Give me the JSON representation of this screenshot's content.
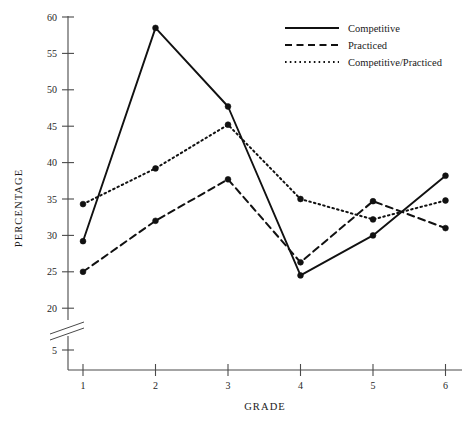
{
  "chart_data": {
    "type": "line",
    "title": "",
    "xlabel": "GRADE",
    "ylabel": "PERCENTAGE",
    "x": [
      1,
      2,
      3,
      4,
      5,
      6
    ],
    "categories": [
      "1",
      "2",
      "3",
      "4",
      "5",
      "6"
    ],
    "xlim": [
      1,
      6
    ],
    "ylim": [
      5,
      60
    ],
    "axis_break": {
      "present": true,
      "between": [
        5,
        20
      ],
      "style": "zigzag"
    },
    "grid": false,
    "legend_position": "top-right",
    "y_ticks": [
      60,
      55,
      50,
      45,
      40,
      35,
      30,
      25,
      20,
      5
    ],
    "y_tick_labels": [
      "60",
      "55",
      "50",
      "45",
      "40",
      "35",
      "30",
      "25",
      "20",
      "5"
    ],
    "x_ticks": [
      1,
      2,
      3,
      4,
      5,
      6
    ],
    "x_tick_labels": [
      "1",
      "2",
      "3",
      "4",
      "5",
      "6"
    ],
    "series": [
      {
        "name": "Competitive",
        "style": "solid",
        "color": "#111111",
        "marker": "circle",
        "values": [
          29.2,
          58.5,
          47.7,
          24.5,
          30.0,
          38.2
        ]
      },
      {
        "name": "Practiced",
        "style": "dashed",
        "color": "#111111",
        "marker": "circle",
        "values": [
          25.0,
          32.0,
          37.7,
          26.3,
          34.7,
          31.0
        ]
      },
      {
        "name": "Competitive/Practiced",
        "style": "dotted",
        "color": "#111111",
        "marker": "circle",
        "values": [
          34.3,
          39.2,
          45.2,
          35.0,
          32.2,
          34.8
        ]
      }
    ]
  },
  "legend": {
    "items": [
      {
        "label": "Competitive",
        "style": "solid"
      },
      {
        "label": "Practiced",
        "style": "dashed"
      },
      {
        "label": "Competitive/Practiced",
        "style": "dotted"
      }
    ]
  },
  "axes": {
    "x_title": "GRADE",
    "y_title": "PERCENTAGE"
  }
}
